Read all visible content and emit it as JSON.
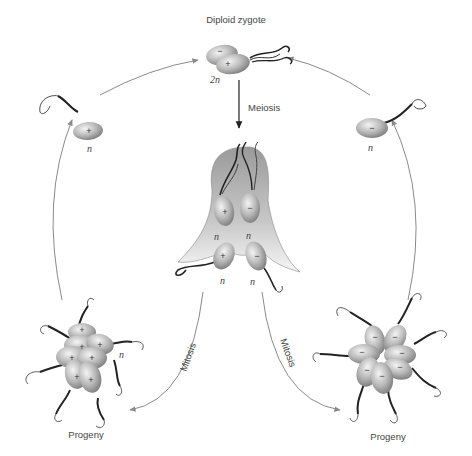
{
  "diagram": {
    "nodes": {
      "zygote": {
        "label": "Diploid zygote",
        "ploidy": "2n",
        "signs": [
          "−",
          "+"
        ]
      },
      "meiosis": {
        "label": "Meiosis"
      },
      "tetrad": {
        "cells": [
          {
            "sign": "+",
            "ploidy": "n"
          },
          {
            "sign": "−",
            "ploidy": "n"
          },
          {
            "sign": "+",
            "ploidy": "n"
          },
          {
            "sign": "−",
            "ploidy": "n"
          }
        ]
      },
      "gamete_plus": {
        "sign": "+",
        "ploidy": "n"
      },
      "gamete_minus": {
        "sign": "−",
        "ploidy": "n"
      },
      "progeny_left": {
        "label": "Progeny",
        "sign": "+",
        "ploidy": "n"
      },
      "progeny_right": {
        "label": "Progeny",
        "sign": "−"
      },
      "mitosis_left": {
        "label": "Mitosis"
      },
      "mitosis_right": {
        "label": "Mitosis"
      }
    },
    "colors": {
      "arrow": "#8a8a8a",
      "cell_fill_light": "#f2f2f2",
      "cell_fill_dark": "#8c8c8c",
      "sac_top": "#9a9a9a",
      "sac_bottom": "#f4f4f4",
      "flagellum": "#222222"
    }
  }
}
